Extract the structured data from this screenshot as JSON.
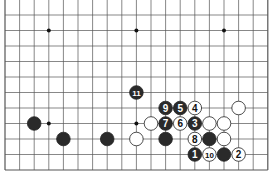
{
  "board": {
    "cols": 19,
    "rows": 11,
    "origin_x": 5,
    "origin_y": 15,
    "dx": 14.6,
    "dy": 15.5,
    "line_color": "#555555",
    "star_points": [
      [
        3,
        1
      ],
      [
        9,
        1
      ],
      [
        15,
        1
      ],
      [
        3,
        7
      ],
      [
        9,
        7
      ]
    ],
    "stones": [
      {
        "color": "black",
        "col": 9,
        "row": 5,
        "label": "11"
      },
      {
        "color": "black",
        "col": 11,
        "row": 6,
        "label": "9"
      },
      {
        "color": "black",
        "col": 12,
        "row": 6,
        "label": "5"
      },
      {
        "color": "white",
        "col": 13,
        "row": 6,
        "label": "4"
      },
      {
        "color": "white",
        "col": 16,
        "row": 6,
        "label": ""
      },
      {
        "color": "black",
        "col": 2,
        "row": 7,
        "label": ""
      },
      {
        "color": "white",
        "col": 10,
        "row": 7,
        "label": ""
      },
      {
        "color": "black",
        "col": 11,
        "row": 7,
        "label": "7"
      },
      {
        "color": "white",
        "col": 12,
        "row": 7,
        "label": "6"
      },
      {
        "color": "black",
        "col": 13,
        "row": 7,
        "label": "3"
      },
      {
        "color": "white",
        "col": 14,
        "row": 7,
        "label": ""
      },
      {
        "color": "white",
        "col": 15,
        "row": 7,
        "label": ""
      },
      {
        "color": "black",
        "col": 4,
        "row": 8,
        "label": ""
      },
      {
        "color": "black",
        "col": 7,
        "row": 8,
        "label": ""
      },
      {
        "color": "white",
        "col": 9,
        "row": 8,
        "label": ""
      },
      {
        "color": "black",
        "col": 11,
        "row": 8,
        "label": ""
      },
      {
        "color": "white",
        "col": 13,
        "row": 8,
        "label": "8"
      },
      {
        "color": "black",
        "col": 14,
        "row": 8,
        "label": ""
      },
      {
        "color": "white",
        "col": 15,
        "row": 8,
        "label": ""
      },
      {
        "color": "black",
        "col": 13,
        "row": 9,
        "label": "1"
      },
      {
        "color": "white",
        "col": 14,
        "row": 9,
        "label": "10"
      },
      {
        "color": "black",
        "col": 15,
        "row": 9,
        "label": ""
      },
      {
        "color": "white",
        "col": 16,
        "row": 9,
        "label": "2"
      }
    ]
  }
}
